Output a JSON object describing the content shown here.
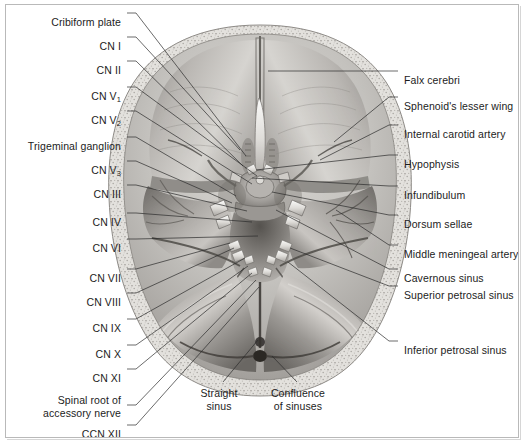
{
  "figure": {
    "image_kind": "grayscale anatomical illustration",
    "border_color": "#b9b9b9",
    "background_color": "#ffffff",
    "text_color": "#1c1c1c"
  },
  "labels_left": [
    {
      "id": "cribiform-plate",
      "text": "Cribiform plate",
      "text2": "",
      "x": 121,
      "y": 16,
      "lx": 127,
      "ly": 13,
      "tx": 246,
      "ty": 156
    },
    {
      "id": "cn-1",
      "text": "CN I",
      "text2": "",
      "x": 121,
      "y": 40,
      "lx": 127,
      "ly": 37,
      "tx": 240,
      "ty": 150
    },
    {
      "id": "cn-2",
      "text": "CN II",
      "text2": "",
      "x": 121,
      "y": 64,
      "lx": 127,
      "ly": 61,
      "tx": 243,
      "ty": 166
    },
    {
      "id": "cn-v1",
      "text": "CN V",
      "sub": "1",
      "x": 121,
      "y": 90,
      "lx": 127,
      "ly": 87,
      "tx": 257,
      "ty": 176
    },
    {
      "id": "cn-v2",
      "text": "CN V",
      "sub": "2",
      "x": 121,
      "y": 114,
      "lx": 127,
      "ly": 111,
      "tx": 252,
      "ty": 184
    },
    {
      "id": "trigeminal-ganglion",
      "text": "Trigeminal ganglion",
      "text2": "",
      "x": 121,
      "y": 140,
      "lx": 127,
      "ly": 137,
      "tx": 236,
      "ty": 196
    },
    {
      "id": "cn-v3",
      "text": "CN V",
      "sub": "3",
      "x": 121,
      "y": 164,
      "lx": 127,
      "ly": 161,
      "tx": 232,
      "ty": 203
    },
    {
      "id": "cn-3",
      "text": "CN III",
      "text2": "",
      "x": 121,
      "y": 188,
      "lx": 127,
      "ly": 185,
      "tx": 247,
      "ty": 211
    },
    {
      "id": "cn-4",
      "text": "CN IV",
      "text2": "",
      "x": 121,
      "y": 216,
      "lx": 127,
      "ly": 213,
      "tx": 252,
      "ty": 222
    },
    {
      "id": "cn-6",
      "text": "CN VI",
      "text2": "",
      "x": 121,
      "y": 242,
      "lx": 127,
      "ly": 239,
      "tx": 258,
      "ty": 236
    },
    {
      "id": "cn-7",
      "text": "CN VII",
      "text2": "",
      "x": 121,
      "y": 272,
      "lx": 127,
      "ly": 269,
      "tx": 230,
      "ty": 243
    },
    {
      "id": "cn-8",
      "text": "CN VIII",
      "text2": "",
      "x": 121,
      "y": 296,
      "lx": 127,
      "ly": 293,
      "tx": 234,
      "ty": 248
    },
    {
      "id": "cn-9",
      "text": "CN IX",
      "text2": "",
      "x": 121,
      "y": 322,
      "lx": 127,
      "ly": 319,
      "tx": 245,
      "ty": 258
    },
    {
      "id": "cn-10",
      "text": "CN X",
      "text2": "",
      "x": 121,
      "y": 348,
      "lx": 127,
      "ly": 345,
      "tx": 248,
      "ty": 266
    },
    {
      "id": "cn-11",
      "text": "CN XI",
      "text2": "",
      "x": 121,
      "y": 372,
      "lx": 127,
      "ly": 369,
      "tx": 252,
      "ty": 273
    },
    {
      "id": "spinal-root-accessory",
      "text": "Spinal root of",
      "text2": "accessory nerve",
      "x": 121,
      "y": 394,
      "lx": 127,
      "ly": 405,
      "tx": 256,
      "ty": 280
    },
    {
      "id": "ccn-12",
      "text": "CCN XII",
      "text2": "",
      "x": 121,
      "y": 428,
      "lx": 127,
      "ly": 425,
      "tx": 259,
      "ty": 287
    }
  ],
  "labels_right": [
    {
      "id": "falx-cerebri",
      "text": "Falx cerebri",
      "x": 404,
      "y": 74,
      "lx": 398,
      "ly": 71,
      "tx": 268,
      "ty": 71
    },
    {
      "id": "sphenoids-lesser-wing",
      "text": "Sphenoid's lesser wing",
      "x": 404,
      "y": 100,
      "lx": 398,
      "ly": 97,
      "tx": 334,
      "ty": 142
    },
    {
      "id": "internal-carotid-artery",
      "text": "Internal carotid artery",
      "x": 404,
      "y": 128,
      "lx": 398,
      "ly": 125,
      "tx": 320,
      "ty": 160
    },
    {
      "id": "hypophysis",
      "text": "Hypophysis",
      "x": 404,
      "y": 158,
      "lx": 398,
      "ly": 155,
      "tx": 256,
      "ty": 170
    },
    {
      "id": "infundibulum",
      "text": "Infundibulum",
      "x": 404,
      "y": 189,
      "lx": 398,
      "ly": 186,
      "tx": 252,
      "ty": 178
    },
    {
      "id": "dorsum-sellae",
      "text": "Dorsum sellae",
      "x": 404,
      "y": 218,
      "lx": 398,
      "ly": 215,
      "tx": 272,
      "ty": 192
    },
    {
      "id": "middle-meningeal-artery",
      "text": "Middle meningeal artery",
      "x": 404,
      "y": 248,
      "lx": 398,
      "ly": 245,
      "tx": 336,
      "ty": 210
    },
    {
      "id": "cavernous-sinus",
      "text": "Cavernous sinus",
      "x": 404,
      "y": 272,
      "lx": 398,
      "ly": 269,
      "tx": 276,
      "ty": 210
    },
    {
      "id": "superior-petrosal-sinus",
      "text": "Superior petrosal sinus",
      "x": 404,
      "y": 289,
      "lx": 398,
      "ly": 286,
      "tx": 290,
      "ty": 248
    },
    {
      "id": "inferior-petrosal-sinus",
      "text": "Inferior petrosal sinus",
      "x": 404,
      "y": 344,
      "lx": 398,
      "ly": 341,
      "tx": 288,
      "ty": 262
    }
  ],
  "labels_bottom": [
    {
      "id": "straight-sinus",
      "text": "Straight",
      "text2": "sinus",
      "x": 219,
      "y": 387,
      "lx": 223,
      "ly": 382,
      "tx": 258,
      "ty": 340
    },
    {
      "id": "confluence-sinuses",
      "text": "Confluence",
      "text2": "of sinuses",
      "x": 298,
      "y": 387,
      "lx": 297,
      "ly": 382,
      "tx": 272,
      "ty": 356
    }
  ],
  "anatomy_regions": [
    {
      "name": "cranial-vault-bone-rim",
      "description": "speckled diploic bone margin surrounding the cranial cavity"
    },
    {
      "name": "anterior-cranial-fossa",
      "description": "paired smooth shelves either side of the crista galli"
    },
    {
      "name": "falx-cerebri-attachment",
      "description": "midline sagittal dural fold from crista galli posteriorly"
    },
    {
      "name": "sella-turcica",
      "description": "central pituitary fossa containing the hypophysis"
    },
    {
      "name": "middle-cranial-fossa",
      "description": "bilateral depressions lateral to the sella"
    },
    {
      "name": "posterior-cranial-fossa",
      "description": "large posterior basin with the tentorium cerebelli"
    },
    {
      "name": "tentorium-cerebelli",
      "description": "paired fan-shaped dural sheets converging posteriorly"
    },
    {
      "name": "confluence-of-sinuses",
      "description": "dark midline junction at the posterior apex"
    }
  ]
}
